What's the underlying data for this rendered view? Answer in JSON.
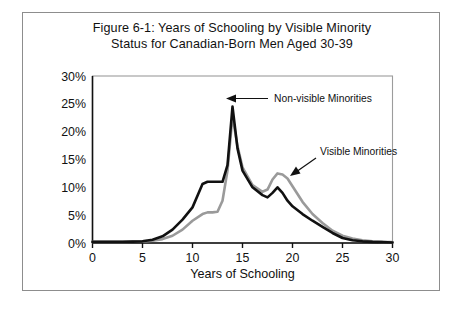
{
  "figure": {
    "title_line1": "Figure 6-1: Years of Schooling by Visible Minority",
    "title_line2": "Status for Canadian-Born Men Aged 30-39",
    "border_color": "#8d8d8d",
    "background": "#ffffff"
  },
  "chart_data": {
    "type": "line",
    "title": "Figure 6-1: Years of Schooling by Visible Minority Status for Canadian-Born Men Aged 30-39",
    "xlabel": "Years of Schooling",
    "ylabel": "",
    "xlim": [
      0,
      30
    ],
    "ylim": [
      0,
      30
    ],
    "grid": false,
    "legend_position": "inline-annotations",
    "xticks": [
      0,
      5,
      10,
      15,
      20,
      25,
      30
    ],
    "xtick_labels": [
      "0",
      "5",
      "10",
      "15",
      "20",
      "25",
      "30"
    ],
    "yticks": [
      0,
      5,
      10,
      15,
      20,
      25,
      30
    ],
    "ytick_labels": [
      "0%",
      "5%",
      "10%",
      "15%",
      "20%",
      "25%",
      "30%"
    ],
    "x": [
      0,
      1,
      2,
      3,
      4,
      5,
      6,
      7,
      8,
      9,
      10,
      11,
      11.5,
      12,
      12.5,
      13,
      13.5,
      14,
      14.5,
      15,
      16,
      17,
      17.5,
      18,
      18.5,
      19,
      19.5,
      20,
      21,
      22,
      23,
      24,
      25,
      26,
      27,
      28,
      29,
      30
    ],
    "series": [
      {
        "name": "Non-visible Minorities",
        "color": "#111111",
        "linewidth": 2.6,
        "values": [
          0.2,
          0.2,
          0.2,
          0.2,
          0.25,
          0.3,
          0.6,
          1.2,
          2.4,
          4.2,
          6.4,
          10.6,
          11.0,
          11.0,
          11.0,
          11.0,
          14.0,
          24.5,
          17.0,
          13.0,
          10.0,
          8.6,
          8.2,
          9.0,
          10.0,
          9.0,
          7.6,
          6.6,
          5.2,
          4.0,
          2.9,
          1.8,
          0.9,
          0.5,
          0.3,
          0.2,
          0.15,
          0.1
        ]
      },
      {
        "name": "Visible Minorities",
        "color": "#9a9a9a",
        "linewidth": 2.6,
        "values": [
          0.2,
          0.2,
          0.2,
          0.2,
          0.25,
          0.3,
          0.4,
          0.7,
          1.3,
          2.4,
          4.0,
          5.2,
          5.5,
          5.5,
          5.6,
          7.6,
          13.0,
          22.8,
          17.4,
          13.6,
          10.4,
          9.2,
          9.6,
          11.4,
          12.5,
          12.3,
          11.6,
          10.2,
          7.4,
          5.2,
          3.6,
          2.2,
          1.3,
          0.8,
          0.5,
          0.3,
          0.2,
          0.15
        ]
      }
    ],
    "annotations": [
      {
        "text": "Non-visible Minorities",
        "points_to_series": "Non-visible Minorities",
        "arrow_direction": "left"
      },
      {
        "text": "Visible Minorities",
        "points_to_series": "Visible Minorities",
        "arrow_direction": "down-left"
      }
    ]
  }
}
